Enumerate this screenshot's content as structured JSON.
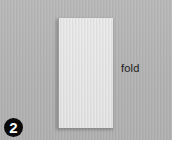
{
  "illustration": {
    "step_number": "2",
    "annotation": "fold",
    "colors": {
      "background": "#b4b4b4",
      "paper": "#e3e3e3",
      "badge": "#0a0a0a",
      "badge_text": "#ffffff",
      "label_text": "#1a1a1a"
    }
  }
}
